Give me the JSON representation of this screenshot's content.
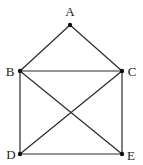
{
  "diagram": {
    "type": "graph",
    "colors": {
      "edge": "#2a2a2a",
      "node": "#111111",
      "label": "#222222",
      "background": "#ffffff"
    },
    "nodes": [
      {
        "id": "A",
        "label": "A",
        "x": 70,
        "y": 25,
        "lx": 70,
        "ly": 16
      },
      {
        "id": "B",
        "label": "B",
        "x": 20,
        "y": 71,
        "lx": 10,
        "ly": 76
      },
      {
        "id": "C",
        "label": "C",
        "x": 122,
        "y": 71,
        "lx": 132,
        "ly": 76
      },
      {
        "id": "D",
        "label": "D",
        "x": 20,
        "y": 154,
        "lx": 11,
        "ly": 159
      },
      {
        "id": "E",
        "label": "E",
        "x": 122,
        "y": 154,
        "lx": 131,
        "ly": 160
      }
    ],
    "edges": [
      [
        "A",
        "B"
      ],
      [
        "A",
        "C"
      ],
      [
        "B",
        "C"
      ],
      [
        "B",
        "D"
      ],
      [
        "B",
        "E"
      ],
      [
        "C",
        "D"
      ],
      [
        "C",
        "E"
      ],
      [
        "D",
        "E"
      ]
    ]
  }
}
